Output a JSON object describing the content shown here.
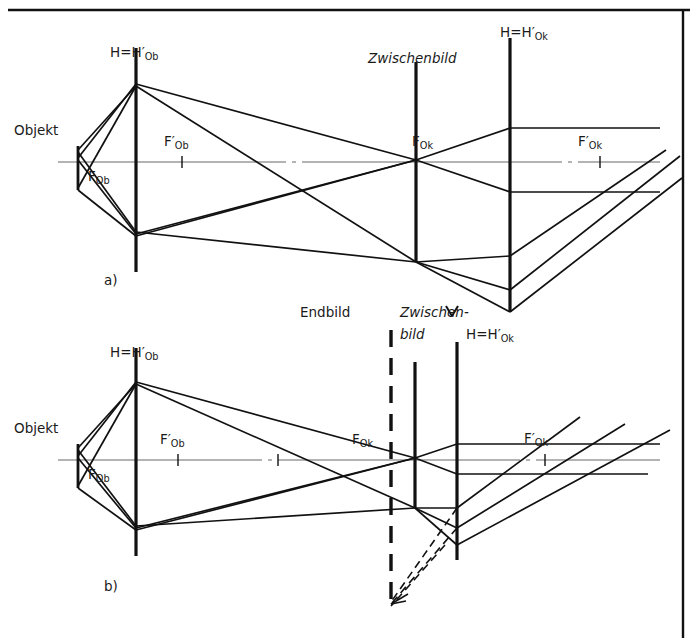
{
  "figure": {
    "kind": "optical-ray-diagram",
    "background": "#ffffff",
    "line_color": "#111111",
    "axis_color": "#9a9a9a"
  },
  "panels": [
    {
      "id": "a",
      "caption": "a)",
      "caption_x": 104,
      "caption_y": 272,
      "axis_y": 162,
      "labels": {
        "object": "Objekt",
        "objective_principal_plane": "H=H′Ob",
        "objective_focal_front": "FOb",
        "objective_focal_back": "F′Ob",
        "intermediate_image": "Zwischenbild",
        "eyepiece_principal_plane": "H=H′Ok",
        "eyepiece_focal_front": "FOk",
        "eyepiece_focal_back": "F′Ok"
      }
    },
    {
      "id": "b",
      "caption": "b)",
      "caption_x": 104,
      "caption_y": 578,
      "axis_y": 460,
      "labels": {
        "object": "Objekt",
        "objective_principal_plane": "H=H′Ob",
        "objective_focal_front": "FOb",
        "objective_focal_back": "F′Ob",
        "final_image": "Endbild",
        "intermediate_image_line1": "Zwischen-",
        "intermediate_image_line2": "bild",
        "eyepiece_principal_plane": "H=H′Ok",
        "eyepiece_focal_front": "FOk",
        "eyepiece_focal_back": "F′Ok"
      }
    }
  ],
  "label_text": {
    "objekt": "Objekt",
    "H_eq": "H=H",
    "Ob": "Ob",
    "Ok": "Ok",
    "F": "F",
    "zwischenbild": "Zwischenbild",
    "zwischen_dash": "Zwischen-",
    "bild": "bild",
    "endbild": "Endbild",
    "caption_a": "a)",
    "caption_b": "b)"
  },
  "geometry": {
    "panel_a": {
      "object_plane_x": 78,
      "objective_x": 136,
      "objective_top_y": 48,
      "objective_bottom_y": 272,
      "intermediate_x": 416,
      "intermediate_top_y": 62,
      "intermediate_bottom_y": 262,
      "eyepiece_x": 510,
      "eyepiece_top_y": 38,
      "eyepiece_bottom_y": 312,
      "focal_mark_Fob_x": 182,
      "focal_mark_Fok_x": 600,
      "object_tip_y": 148,
      "object_base_y": 188
    },
    "panel_b": {
      "object_plane_x": 78,
      "objective_x": 136,
      "objective_top_y": 348,
      "objective_bottom_y": 556,
      "endbild_x": 391,
      "endbild_top_y": 330,
      "endbild_bottom_y": 608,
      "intermediate_x": 415,
      "intermediate_top_y": 362,
      "intermediate_bottom_y": 508,
      "eyepiece_x": 457,
      "eyepiece_top_y": 342,
      "eyepiece_bottom_y": 560,
      "focal_mark_Fob_x": 178,
      "focal_mark_Fok_x": 278,
      "focal_mark_Fokp_x": 545,
      "object_tip_y": 446,
      "object_base_y": 486
    }
  },
  "frame": {
    "top_rule_y": 10,
    "right_rule_x": 683
  }
}
